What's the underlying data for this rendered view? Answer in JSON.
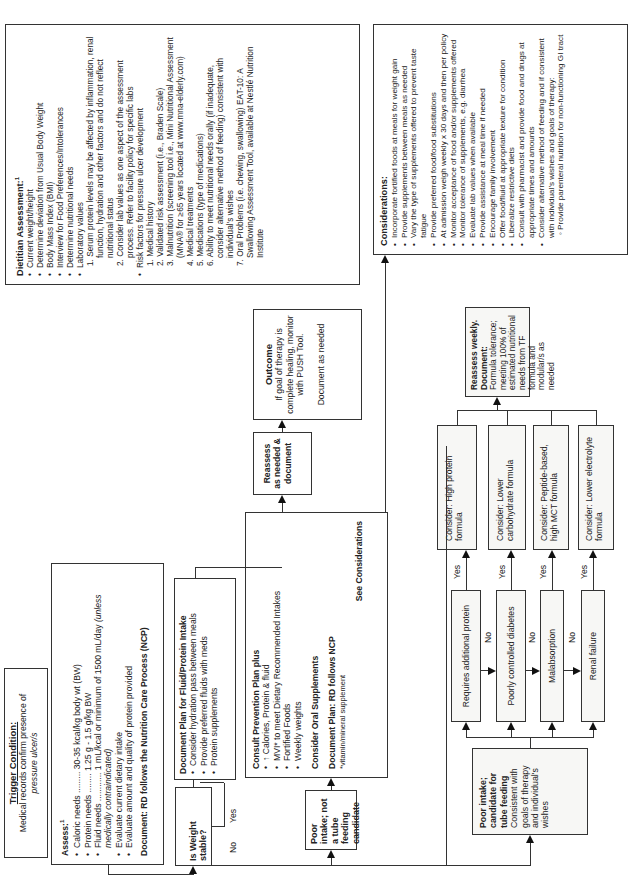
{
  "trigger": {
    "title": "Trigger Condition:",
    "text": "Medical records confirm presence of",
    "text_italic": "pressure ulcer/s"
  },
  "assess": {
    "title": "Assess:",
    "sup": "1",
    "items": [
      "Caloric needs ......... 30-35 kcal/kg body wt (BW)",
      "Protein needs ........ 1.25 g - 1.5 g/kg BW",
      "Fluid needs ............ 1 mL/kcal or minimum of 1500 mL/day",
      "Evaluate current dietary intake",
      "Evaluate amount and quality of protein provided"
    ],
    "fluid_note": "(unless medically contraindicated)",
    "document": "Document: RD follows the Nutrition Care Process (NCP)"
  },
  "weight": {
    "question": "Is Weight stable?",
    "no": "No",
    "yes": "Yes"
  },
  "doc_plan_fluid": {
    "title": "Document Plan for Fluid/Protein Intake",
    "items": [
      "Consider hydration pass between meals",
      "Provide preferred fluids with meds",
      "Protein supplements"
    ]
  },
  "poor_intake_not_tube": {
    "title": "Poor intake; not a tube feeding candidate"
  },
  "consult_prevention": {
    "title": "Consult Prevention Plan plus",
    "items": [
      "↑ Calories, Protein & fluid",
      "MVI* to meet Dietary Recommended Intakes",
      "Fortified Foods",
      "Weekly weights"
    ],
    "oral": "Consider Oral Supplements",
    "doc": "Document Plan: RD follows NCP",
    "footnote": "*vitamin/mineral supplement",
    "see": "See Considerations"
  },
  "reassess": {
    "text": "Reassess as needed & document"
  },
  "outcome": {
    "title": "Outcome",
    "text": "If goal of therapy is complete healing, monitor with PUSH Tool.",
    "doc": "Document as needed"
  },
  "dietitian": {
    "title": "Dietitian Assessment:",
    "sup": "1",
    "items": [
      "Current weight/height",
      "Determine deviation from Usual Body Weight",
      "Body Mass Index (BMI)",
      "Interview for Food Preferences/Intolerances",
      "Determine nutritional needs",
      "Laboratory values"
    ],
    "lab_sub": [
      "1. Serum protein levels may be affected by inflammation, renal function, hydration and other factors and do not reflect nutritional status",
      "2. Consider lab values as one aspect of the assessment process. Refer to facility policy for specific labs"
    ],
    "risk_title": "Risk factors for pressure ulcer development",
    "risk_sub": [
      "1. Medical history",
      "2. Validated risk assessment (i.e., Braden Scale)",
      "3. Malnutrition (screening tool i.e., Mini Nutritional Assessment (MNA® for ≥65 years located at www.mna-elderly.com)",
      "4. Medical treatments",
      "5. Medications (type of medications)",
      "6. Ability to meet nutritional needs orally (if inadequate, consider alternative method of feeding) consistent with individual's wishes",
      "7. Oral Problems (i.e. chewing, swallowing) EAT-10: A Swallowing Assessment Tool, available at Nestlé Nutrition Institute"
    ]
  },
  "considerations": {
    "title": "Considerations:",
    "items": [
      "Incorporate fortified foods at meals for weight gain",
      "Provide supplements between meals as needed",
      "Vary the type of supplements offered to prevent taste fatigue",
      "Provide preferred food/food substitutions",
      "At admission weigh weekly x 30 days and then per policy",
      "Monitor acceptance of food and/or supplements offered",
      "Monitor tolerance of supplements, e.g. diarrhea",
      "Evaluate lab values when available",
      "Provide assistance at meal time if needed",
      "Encourage family involvement",
      "Offer food/fluid at appropriate texture for condition",
      "Liberalize restrictive diets",
      "Consult with pharmacist and provide food and drugs at appropriate times and amounts",
      "Consider alternative method of feeding and if consistent with individual's wishes and goals of therapy:"
    ],
    "sub": "Provide parenteral nutrition for non-functioning GI tract"
  },
  "tube": {
    "title": "Poor intake; candidate for tube feeding",
    "text": "Consistent with goals of therapy and individual's wishes"
  },
  "conditions": [
    {
      "label": "Requires additional protein",
      "consider": "Consider: High protein formula"
    },
    {
      "label": "Poorly controlled diabetes",
      "consider": "Consider: Lower carbohydrate formula"
    },
    {
      "label": "Malabsorption",
      "consider": "Consider: Peptide-based, high MCT formula"
    },
    {
      "label": "Renal failure",
      "consider": "Consider: Lower electrolyte formula"
    }
  ],
  "yes_label": "Yes",
  "no_label": "No",
  "reassess_weekly": {
    "title": "Reassess weekly.",
    "doc": "Document:",
    "text": "Formula tolerance; meeting 100% of estimated nutritional needs from TF formula and modular/s as needed"
  }
}
